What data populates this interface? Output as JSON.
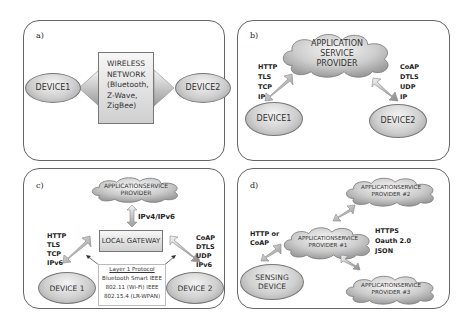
{
  "panels": {
    "a": {
      "label": "a)",
      "device1": "DEVICE1",
      "device2": "DEVICE2",
      "network": [
        "WIRELESS",
        "NETWORK",
        "(Bluetooth,",
        "Z-Wave,",
        "ZigBee)"
      ]
    },
    "b": {
      "label": "b)",
      "cloud": [
        "APPLICATION",
        "SERVICE",
        "PROVIDER"
      ],
      "left_protocols": [
        "HTTP",
        "TLS",
        "TCP",
        "IP"
      ],
      "right_protocols": [
        "CoAP",
        "DTLS",
        "UDP",
        "IP"
      ],
      "device1": "DEVICE1",
      "device2": "DEVICE2"
    },
    "c": {
      "label": "c)",
      "cloud": [
        "APPLICATIONSERVICE",
        "PROVIDER"
      ],
      "link_label": "IPv4/IPv6",
      "gateway": "LOCAL GATEWAY",
      "left_protocols": [
        "HTTP",
        "TLS",
        "TCP",
        "IPv6"
      ],
      "right_protocols": [
        "CoAP",
        "DTLS",
        "UDP",
        "IPv6"
      ],
      "layer_title": "Layer 1 Protocol",
      "layer_lines": [
        "Bluetooth Smart IEEE",
        "802.11 (Wi-Fi) IEEE",
        "802.15.4 (LR-WPAN)"
      ],
      "device1": "DEVICE 1",
      "device2": "DEVICE 2"
    },
    "d": {
      "label": "d)",
      "provider1": [
        "APPLICATIONSERVICE",
        "PROVIDER #1"
      ],
      "provider2": [
        "APPLICATIONSERVICE",
        "PROVIDER #2"
      ],
      "provider3": [
        "APPLICATIONSERVICE",
        "PROVIDER #3"
      ],
      "left_protocols": [
        "HTTP or",
        "CoAP"
      ],
      "right_protocols": [
        "HTTPS",
        "Oauth 2.0",
        "JSON"
      ],
      "sensing_device": [
        "SENSING",
        "DEVICE"
      ]
    }
  }
}
